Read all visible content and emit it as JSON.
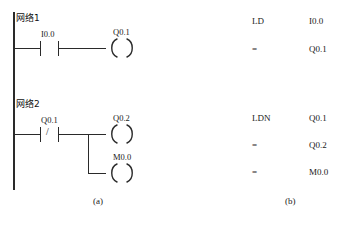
{
  "figure": {
    "captions": [
      {
        "text": "(a)",
        "x": 93,
        "y": 196
      },
      {
        "text": "(b)",
        "x": 285,
        "y": 196
      }
    ]
  },
  "ladder": {
    "rail": {
      "x": 13,
      "y_top": 12,
      "y_bottom": 190,
      "thickness": 1.6
    },
    "networks": [
      {
        "label": "网络1",
        "label_x": 16,
        "label_y": 13,
        "rung_y": 48,
        "contacts": [
          {
            "name": "I0.0",
            "type": "normally-open",
            "x": 40,
            "label_x": 41,
            "label_y": 29
          }
        ],
        "coils": [
          {
            "name": "Q0.1",
            "x": 106,
            "y": 38,
            "label_x": 113,
            "label_y": 27,
            "rung_y": 48
          }
        ],
        "branch": null
      },
      {
        "label": "网络2",
        "label_x": 16,
        "label_y": 99,
        "rung_y": 134,
        "contacts": [
          {
            "name": "Q0.1",
            "type": "normally-closed",
            "x": 40,
            "label_x": 41,
            "label_y": 115
          }
        ],
        "coils": [
          {
            "name": "Q0.2",
            "x": 106,
            "y": 124,
            "label_x": 113,
            "label_y": 113,
            "rung_y": 134
          },
          {
            "name": "M0.0",
            "x": 106,
            "y": 163,
            "label_x": 113,
            "label_y": 152,
            "rung_y": 173
          }
        ],
        "branch": {
          "x": 88,
          "y_top": 134,
          "y_bottom": 173
        }
      }
    ]
  },
  "statement_list": {
    "blocks": [
      {
        "rows": [
          {
            "op": "LD",
            "operand": "I0.0",
            "y": 16
          },
          {
            "op": "=",
            "operand": "Q0.1",
            "y": 44
          }
        ]
      },
      {
        "rows": [
          {
            "op": "LDN",
            "operand": "Q0.1",
            "y": 113
          },
          {
            "op": "=",
            "operand": "Q0.2",
            "y": 140
          },
          {
            "op": "=",
            "operand": "M0.0",
            "y": 167
          }
        ]
      }
    ],
    "op_x": 252,
    "operand_x": 309
  }
}
